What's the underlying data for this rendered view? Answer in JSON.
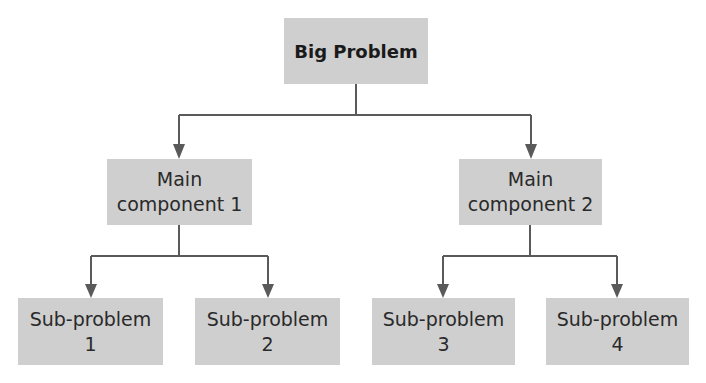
{
  "diagram": {
    "type": "hierarchy-tree",
    "colors": {
      "box_fill": "#cfcfcf",
      "line": "#5a5a5a",
      "text": "#2a2a2a"
    },
    "root": {
      "label": "Big Problem"
    },
    "main_components": [
      {
        "line1": "Main",
        "line2": "component 1"
      },
      {
        "line1": "Main",
        "line2": "component 2"
      }
    ],
    "sub_problems": [
      {
        "line1": "Sub-problem",
        "line2": "1"
      },
      {
        "line1": "Sub-problem",
        "line2": "2"
      },
      {
        "line1": "Sub-problem",
        "line2": "3"
      },
      {
        "line1": "Sub-problem",
        "line2": "4"
      }
    ],
    "edges": [
      [
        "Big Problem",
        "Main component 1"
      ],
      [
        "Big Problem",
        "Main component 2"
      ],
      [
        "Main component 1",
        "Sub-problem 1"
      ],
      [
        "Main component 1",
        "Sub-problem 2"
      ],
      [
        "Main component 2",
        "Sub-problem 3"
      ],
      [
        "Main component 2",
        "Sub-problem 4"
      ]
    ]
  }
}
